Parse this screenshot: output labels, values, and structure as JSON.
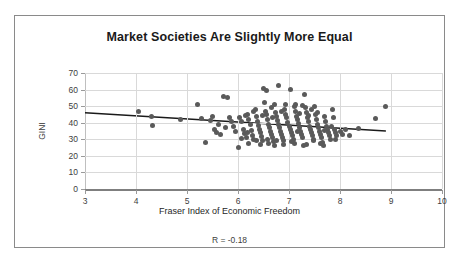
{
  "chart_data": {
    "type": "scatter",
    "title": "Market Societies Are Slightly More Equal",
    "xlabel": "Fraser Index of Economic Freedom",
    "ylabel": "GINI",
    "xlim": [
      3,
      10
    ],
    "ylim": [
      0,
      70
    ],
    "xticks": [
      3,
      4,
      5,
      6,
      7,
      8,
      9,
      10
    ],
    "yticks": [
      0,
      10,
      20,
      30,
      40,
      50,
      60,
      70
    ],
    "grid": true,
    "legend": "none",
    "annotation": "R = -0.18",
    "correlation": -0.18,
    "marker_color": "#5a5a5a",
    "trendline_color": "#1a1a1a",
    "gridline_color": "#d9d9d9",
    "trendline": {
      "x": [
        3,
        8.9
      ],
      "y": [
        46,
        35
      ]
    },
    "points": [
      [
        4.05,
        47
      ],
      [
        4.3,
        44
      ],
      [
        4.32,
        38.3
      ],
      [
        4.87,
        42
      ],
      [
        5.2,
        51
      ],
      [
        5.36,
        28
      ],
      [
        5.28,
        42.5
      ],
      [
        5.46,
        41.5
      ],
      [
        5.5,
        44
      ],
      [
        5.54,
        36
      ],
      [
        5.58,
        34
      ],
      [
        5.66,
        33
      ],
      [
        5.72,
        56
      ],
      [
        5.8,
        55
      ],
      [
        5.84,
        43
      ],
      [
        5.88,
        40.5
      ],
      [
        5.92,
        38
      ],
      [
        5.96,
        35
      ],
      [
        6.0,
        25.3
      ],
      [
        6.02,
        43
      ],
      [
        6.06,
        41
      ],
      [
        6.1,
        36
      ],
      [
        6.12,
        33.5
      ],
      [
        6.16,
        31
      ],
      [
        6.18,
        45
      ],
      [
        6.2,
        42
      ],
      [
        6.24,
        39
      ],
      [
        6.26,
        35.5
      ],
      [
        6.28,
        32
      ],
      [
        6.3,
        30
      ],
      [
        6.34,
        48
      ],
      [
        6.36,
        44
      ],
      [
        6.38,
        41
      ],
      [
        6.4,
        38.5
      ],
      [
        6.42,
        36
      ],
      [
        6.44,
        34
      ],
      [
        6.46,
        31.5
      ],
      [
        6.48,
        29
      ],
      [
        6.5,
        60.5
      ],
      [
        6.52,
        52
      ],
      [
        6.54,
        47
      ],
      [
        6.56,
        45
      ],
      [
        6.58,
        42
      ],
      [
        6.6,
        39
      ],
      [
        6.62,
        37
      ],
      [
        6.64,
        35
      ],
      [
        6.66,
        33
      ],
      [
        6.68,
        31
      ],
      [
        6.7,
        28.5
      ],
      [
        6.72,
        26.5
      ],
      [
        6.56,
        59.5
      ],
      [
        6.74,
        46
      ],
      [
        6.76,
        44
      ],
      [
        6.78,
        41.5
      ],
      [
        6.8,
        39
      ],
      [
        6.82,
        37
      ],
      [
        6.84,
        35
      ],
      [
        6.86,
        33
      ],
      [
        6.88,
        31
      ],
      [
        6.9,
        29
      ],
      [
        6.8,
        62.5
      ],
      [
        6.92,
        48
      ],
      [
        6.94,
        45
      ],
      [
        6.96,
        43
      ],
      [
        6.98,
        40
      ],
      [
        7.0,
        38
      ],
      [
        7.02,
        36
      ],
      [
        7.04,
        34
      ],
      [
        7.06,
        32
      ],
      [
        7.08,
        30
      ],
      [
        7.02,
        60
      ],
      [
        7.1,
        50
      ],
      [
        7.12,
        47
      ],
      [
        7.14,
        44
      ],
      [
        7.16,
        42
      ],
      [
        7.18,
        39.5
      ],
      [
        7.2,
        37
      ],
      [
        7.22,
        35
      ],
      [
        7.24,
        33
      ],
      [
        7.26,
        31
      ],
      [
        7.28,
        26
      ],
      [
        7.3,
        57
      ],
      [
        7.32,
        49
      ],
      [
        7.34,
        46
      ],
      [
        7.36,
        43
      ],
      [
        7.38,
        41
      ],
      [
        7.4,
        38
      ],
      [
        7.42,
        36
      ],
      [
        7.44,
        34
      ],
      [
        7.46,
        32
      ],
      [
        7.48,
        30
      ],
      [
        7.5,
        50
      ],
      [
        7.52,
        45
      ],
      [
        7.54,
        42
      ],
      [
        7.56,
        39
      ],
      [
        7.58,
        37
      ],
      [
        7.6,
        35
      ],
      [
        7.62,
        33
      ],
      [
        7.64,
        31
      ],
      [
        7.66,
        28
      ],
      [
        7.68,
        26.2
      ],
      [
        7.7,
        44
      ],
      [
        7.72,
        41
      ],
      [
        7.74,
        38
      ],
      [
        7.76,
        36
      ],
      [
        7.78,
        34
      ],
      [
        7.8,
        32
      ],
      [
        7.82,
        30
      ],
      [
        7.86,
        48
      ],
      [
        7.88,
        43
      ],
      [
        7.9,
        36
      ],
      [
        7.92,
        34
      ],
      [
        7.94,
        32.5
      ],
      [
        8.0,
        35
      ],
      [
        8.05,
        33
      ],
      [
        8.1,
        36
      ],
      [
        8.18,
        32
      ],
      [
        8.36,
        36.3
      ],
      [
        8.7,
        42.5
      ],
      [
        8.9,
        50
      ],
      [
        6.44,
        27
      ],
      [
        6.6,
        27.5
      ],
      [
        6.9,
        27
      ],
      [
        7.1,
        27.5
      ],
      [
        7.34,
        27
      ],
      [
        6.2,
        27.5
      ],
      [
        6.36,
        29.5
      ],
      [
        7.62,
        27.5
      ],
      [
        6.66,
        49
      ],
      [
        6.72,
        51
      ],
      [
        7.12,
        51
      ],
      [
        7.26,
        50.5
      ],
      [
        6.3,
        47
      ],
      [
        6.18,
        34
      ],
      [
        6.06,
        30.5
      ],
      [
        7.44,
        48
      ],
      [
        7.56,
        46
      ],
      [
        6.94,
        51
      ],
      [
        6.48,
        44.5
      ],
      [
        7.2,
        45.5
      ],
      [
        6.86,
        47
      ],
      [
        7.38,
        44.5
      ],
      [
        7.7,
        35.5
      ],
      [
        7.84,
        38
      ],
      [
        6.58,
        30
      ],
      [
        6.76,
        29
      ],
      [
        7.04,
        28.5
      ],
      [
        7.48,
        29
      ],
      [
        5.62,
        39
      ],
      [
        5.76,
        37
      ],
      [
        6.14,
        44.5
      ],
      [
        6.68,
        43
      ],
      [
        7.16,
        34.5
      ],
      [
        7.92,
        30
      ]
    ]
  },
  "caption_strip": ""
}
